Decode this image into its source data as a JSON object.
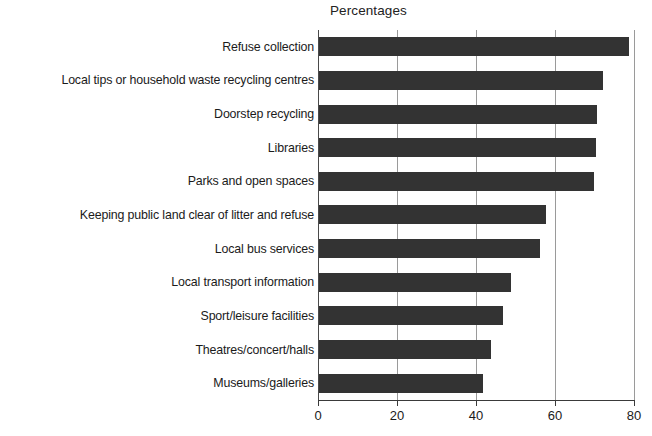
{
  "chart_data": {
    "type": "bar",
    "orientation": "horizontal",
    "title": "Percentages",
    "xlabel": "",
    "ylabel": "",
    "xlim": [
      0,
      80
    ],
    "xticks": [
      0,
      20,
      40,
      60,
      80
    ],
    "xtick_labels": [
      "0",
      "20",
      "40",
      "60",
      "80"
    ],
    "grid": true,
    "grid_axis": "x",
    "legend": false,
    "bar_color": "#333333",
    "background_color": "#ffffff",
    "categories": [
      "Refuse collection",
      "Local tips or household waste recycling centres",
      "Doorstep recycling",
      "Libraries",
      "Parks and open spaces",
      "Keeping public land clear of litter and refuse",
      "Local bus services",
      "Local transport information",
      "Sport/leisure facilities",
      "Theatres/concert/halls",
      "Museums/galleries"
    ],
    "values": [
      78.5,
      72,
      70.5,
      70,
      69.5,
      57.5,
      56,
      48.5,
      46.5,
      43.5,
      41.5
    ]
  }
}
